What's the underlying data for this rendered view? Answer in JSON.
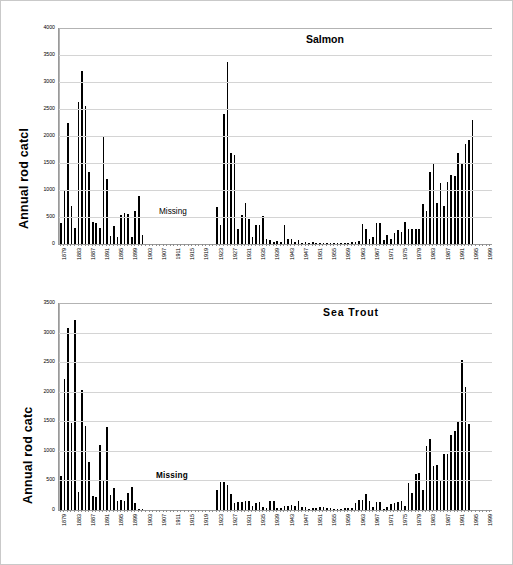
{
  "figure": {
    "background": "#ffffff",
    "bar_color": "#000000",
    "grid_color": "#d4d4d4",
    "axis_color": "#9a9a9a"
  },
  "charts": [
    {
      "id": "salmon",
      "title": "Salmon",
      "ylabel": "Annual rod catcl",
      "missing_note": "Missing",
      "ylim": [
        0,
        4000
      ],
      "yticks": [
        0,
        500,
        1000,
        1500,
        2000,
        2500,
        3000,
        3500,
        4000
      ],
      "ytick_labels": [
        "0",
        "500",
        "1000",
        "1500",
        "2000",
        "2500",
        "3000",
        "3500",
        "4000"
      ],
      "xlabels": [
        "1879",
        "1883",
        "1887",
        "1891",
        "1895",
        "1899",
        "1903",
        "1907",
        "1911",
        "1915",
        "1919",
        "1923",
        "1927",
        "1931",
        "1935",
        "1939",
        "1943",
        "1947",
        "1951",
        "1955",
        "1959",
        "1963",
        "1967",
        "1971",
        "1975",
        "1979",
        "1983",
        "1987",
        "1991",
        "1995",
        "1999"
      ],
      "xlabel_start_year": 1879,
      "xlabel_step": 4
    },
    {
      "id": "seatrout",
      "title": "Sea Trout",
      "ylabel": "Annual rod catc",
      "missing_note": "Missing",
      "ylim": [
        0,
        3500
      ],
      "yticks": [
        0,
        500,
        1000,
        1500,
        2000,
        2500,
        3000,
        3500
      ],
      "ytick_labels": [
        "0",
        "500",
        "1000",
        "1500",
        "2000",
        "2500",
        "3000",
        "3500"
      ],
      "xlabels": [
        "1879",
        "1883",
        "1887",
        "1891",
        "1895",
        "1899",
        "1903",
        "1907",
        "1911",
        "1915",
        "1919",
        "1923",
        "1927",
        "1931",
        "1935",
        "1939",
        "1943",
        "1947",
        "1951",
        "1955",
        "1959",
        "1963",
        "1967",
        "1971",
        "1975",
        "1979",
        "1983",
        "1987",
        "1991",
        "1995",
        "1999"
      ],
      "xlabel_start_year": 1879,
      "xlabel_step": 4
    }
  ],
  "chart_data": [
    {
      "type": "bar",
      "title": "Salmon",
      "xlabel": "",
      "ylabel": "Annual rod catch",
      "ylim": [
        0,
        4000
      ],
      "yticks": [
        0,
        500,
        1000,
        1500,
        2000,
        2500,
        3000,
        3500,
        4000
      ],
      "grid": true,
      "legend": "none",
      "annotations": [
        {
          "text": "Missing",
          "x_year_range": [
            1900,
            1922
          ]
        }
      ],
      "x_start_year": 1879,
      "x_end_year": 2000,
      "categories": [
        1879,
        1880,
        1881,
        1882,
        1883,
        1884,
        1885,
        1886,
        1887,
        1888,
        1889,
        1890,
        1891,
        1892,
        1893,
        1894,
        1895,
        1896,
        1897,
        1898,
        1899,
        1900,
        1901,
        1902,
        1903,
        1904,
        1905,
        1906,
        1907,
        1908,
        1909,
        1910,
        1911,
        1912,
        1913,
        1914,
        1915,
        1916,
        1917,
        1918,
        1919,
        1920,
        1921,
        1922,
        1923,
        1924,
        1925,
        1926,
        1927,
        1928,
        1929,
        1930,
        1931,
        1932,
        1933,
        1934,
        1935,
        1936,
        1937,
        1938,
        1939,
        1940,
        1941,
        1942,
        1943,
        1944,
        1945,
        1946,
        1947,
        1948,
        1949,
        1950,
        1951,
        1952,
        1953,
        1954,
        1955,
        1956,
        1957,
        1958,
        1959,
        1960,
        1961,
        1962,
        1963,
        1964,
        1965,
        1966,
        1967,
        1968,
        1969,
        1970,
        1971,
        1972,
        1973,
        1974,
        1975,
        1976,
        1977,
        1978,
        1979,
        1980,
        1981,
        1982,
        1983,
        1984,
        1985,
        1986,
        1987,
        1988,
        1989,
        1990,
        1991,
        1992,
        1993,
        1994,
        1995,
        1996,
        1997,
        1998,
        1999,
        2000
      ],
      "values": [
        390,
        975,
        2240,
        710,
        305,
        2630,
        3205,
        2555,
        1330,
        410,
        390,
        295,
        2000,
        1200,
        150,
        325,
        135,
        540,
        570,
        565,
        130,
        605,
        895,
        160,
        null,
        null,
        null,
        null,
        null,
        null,
        null,
        null,
        null,
        null,
        null,
        null,
        null,
        null,
        null,
        null,
        null,
        null,
        null,
        null,
        680,
        350,
        2410,
        3375,
        1685,
        1650,
        270,
        540,
        765,
        465,
        135,
        350,
        345,
        510,
        95,
        80,
        45,
        55,
        35,
        345,
        100,
        90,
        35,
        80,
        25,
        30,
        25,
        35,
        20,
        20,
        15,
        15,
        25,
        20,
        20,
        15,
        15,
        25,
        30,
        35,
        55,
        370,
        285,
        90,
        125,
        385,
        395,
        80,
        170,
        95,
        205,
        265,
        230,
        415,
        280,
        285,
        280,
        275,
        745,
        620,
        1330,
        1475,
        765,
        1130,
        710,
        1150,
        1270,
        1265,
        1690,
        1490,
        1845,
        1925,
        2305
      ],
      "missing_years": [
        1903,
        1904,
        1905,
        1906,
        1907,
        1908,
        1909,
        1910,
        1911,
        1912,
        1913,
        1914,
        1915,
        1916,
        1917,
        1918,
        1919,
        1920,
        1921,
        1922
      ]
    },
    {
      "type": "bar",
      "title": "Sea Trout",
      "xlabel": "",
      "ylabel": "Annual rod catch",
      "ylim": [
        0,
        3500
      ],
      "yticks": [
        0,
        500,
        1000,
        1500,
        2000,
        2500,
        3000,
        3500
      ],
      "grid": true,
      "legend": "none",
      "annotations": [
        {
          "text": "Missing",
          "x_year_range": [
            1900,
            1922
          ]
        }
      ],
      "x_start_year": 1879,
      "x_end_year": 2000,
      "categories": [
        1879,
        1880,
        1881,
        1882,
        1883,
        1884,
        1885,
        1886,
        1887,
        1888,
        1889,
        1890,
        1891,
        1892,
        1893,
        1894,
        1895,
        1896,
        1897,
        1898,
        1899,
        1900,
        1901,
        1902,
        1903,
        1904,
        1905,
        1906,
        1907,
        1908,
        1909,
        1910,
        1911,
        1912,
        1913,
        1914,
        1915,
        1916,
        1917,
        1918,
        1919,
        1920,
        1921,
        1922,
        1923,
        1924,
        1925,
        1926,
        1927,
        1928,
        1929,
        1930,
        1931,
        1932,
        1933,
        1934,
        1935,
        1936,
        1937,
        1938,
        1939,
        1940,
        1941,
        1942,
        1943,
        1944,
        1945,
        1946,
        1947,
        1948,
        1949,
        1950,
        1951,
        1952,
        1953,
        1954,
        1955,
        1956,
        1957,
        1958,
        1959,
        1960,
        1961,
        1962,
        1963,
        1964,
        1965,
        1966,
        1967,
        1968,
        1969,
        1970,
        1971,
        1972,
        1973,
        1974,
        1975,
        1976,
        1977,
        1978,
        1979,
        1980,
        1981,
        1982,
        1983,
        1984,
        1985,
        1986,
        1987,
        1988,
        1989,
        1990,
        1991,
        1992,
        1993,
        1994,
        1995,
        1996,
        1997,
        1998,
        1999,
        2000
      ],
      "values": [
        580,
        2210,
        3070,
        1475,
        3205,
        305,
        2035,
        1425,
        805,
        240,
        215,
        1105,
        510,
        1405,
        255,
        380,
        150,
        165,
        155,
        290,
        385,
        115,
        10,
        5,
        null,
        null,
        null,
        null,
        null,
        null,
        null,
        null,
        null,
        null,
        null,
        null,
        null,
        null,
        null,
        null,
        null,
        null,
        null,
        null,
        330,
        475,
        470,
        425,
        265,
        115,
        130,
        140,
        155,
        145,
        60,
        125,
        130,
        55,
        40,
        160,
        160,
        30,
        40,
        70,
        65,
        90,
        60,
        150,
        55,
        45,
        25,
        35,
        30,
        55,
        50,
        30,
        35,
        15,
        10,
        10,
        30,
        40,
        40,
        115,
        175,
        170,
        265,
        155,
        50,
        140,
        130,
        25,
        55,
        100,
        120,
        140,
        155,
        60,
        455,
        290,
        610,
        630,
        345,
        1085,
        1195,
        740,
        760,
        515,
        940,
        955,
        1265,
        1330,
        1510,
        2535,
        2085,
        1460
      ],
      "missing_years": [
        1903,
        1904,
        1905,
        1906,
        1907,
        1908,
        1909,
        1910,
        1911,
        1912,
        1913,
        1914,
        1915,
        1916,
        1917,
        1918,
        1919,
        1920,
        1921,
        1922
      ]
    }
  ]
}
